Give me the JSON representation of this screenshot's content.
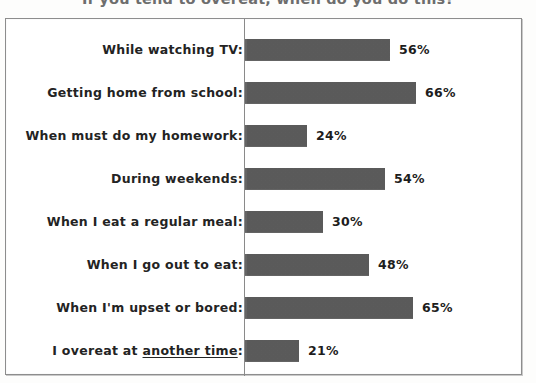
{
  "chart_data": {
    "type": "bar",
    "orientation": "horizontal",
    "title": "If you tend to overeat, when do you do this?",
    "xlabel": "",
    "ylabel": "",
    "xlim": [
      0,
      100
    ],
    "grid": false,
    "legend": false,
    "value_suffix": "%",
    "categories": [
      "While watching TV:",
      "Getting home from school:",
      "When must do my homework:",
      "During weekends:",
      "When I eat a regular meal:",
      "When I go out to eat:",
      "When I'm upset or bored:",
      "I overeat at another time:"
    ],
    "values": [
      56,
      66,
      24,
      54,
      30,
      48,
      65,
      21
    ],
    "data_labels": [
      "56%",
      "66%",
      "24%",
      "54%",
      "30%",
      "48%",
      "65%",
      "21%"
    ],
    "colors": {
      "bar_fill": "#5f5f5f",
      "axis_line": "#8a8a8a",
      "frame": "#8d8d8d",
      "label_text": "#232323",
      "title_text": "#6d6d6d",
      "background": "#ffffff"
    },
    "rows": [
      {
        "label": "While watching TV:",
        "label_plain": "While watching TV",
        "underline_part": "",
        "value": 56,
        "label_value": "56%"
      },
      {
        "label": "Getting home from school:",
        "label_plain": "Getting home from school",
        "underline_part": "",
        "value": 66,
        "label_value": "66%"
      },
      {
        "label": "When must do my homework:",
        "label_plain": "When must do my homework",
        "underline_part": "",
        "value": 24,
        "label_value": "24%"
      },
      {
        "label": "During weekends:",
        "label_plain": "During weekends",
        "underline_part": "",
        "value": 54,
        "label_value": "54%"
      },
      {
        "label": "When I eat a regular meal:",
        "label_plain": "When I eat a regular meal",
        "underline_part": "",
        "value": 30,
        "label_value": "30%"
      },
      {
        "label": "When I go out to eat:",
        "label_plain": "When I go out to eat",
        "underline_part": "",
        "value": 48,
        "label_value": "48%"
      },
      {
        "label": "When I'm upset or bored:",
        "label_plain": "When I'm upset or bored",
        "underline_part": "",
        "value": 65,
        "label_value": "65%"
      },
      {
        "label": "I overeat at another time:",
        "label_prefix": "I overeat at ",
        "underline_part": "another time",
        "label_suffix": ":",
        "value": 21,
        "label_value": "21%"
      }
    ]
  }
}
